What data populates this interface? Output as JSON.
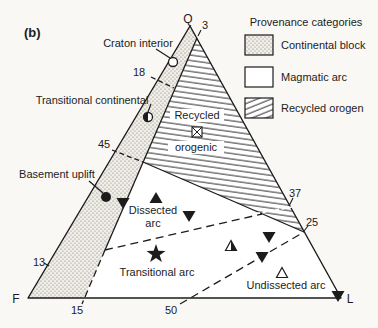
{
  "figure": {
    "panel_label": "(b)",
    "corners": {
      "top": "Q",
      "bottom_left": "F",
      "bottom_right": "L"
    },
    "ticks": {
      "t3": "3",
      "t18": "18",
      "t45": "45",
      "t13": "13",
      "t15": "15",
      "t50": "50",
      "t37": "37",
      "t25": "25"
    },
    "fields": {
      "craton_interior": "Craton interior",
      "transitional_continental": "Transitional continental",
      "basement_uplift": "Basement uplift",
      "recycled_line1": "Recycled",
      "recycled_line2": "orogenic",
      "dissected_line1": "Dissected",
      "dissected_line2": "arc",
      "transitional_arc": "Transitional arc",
      "undissected_arc": "Undissected arc"
    },
    "legend": {
      "title": "Provenance categories",
      "items": [
        {
          "label": "Continental block",
          "pattern": "stipple"
        },
        {
          "label": "Magmatic arc",
          "pattern": "none"
        },
        {
          "label": "Recycled orogen",
          "pattern": "hatch"
        }
      ]
    },
    "colors": {
      "ink": "#1c1c1c",
      "background": "#f9f8f5",
      "paper": "#ffffff"
    },
    "markers": [
      {
        "symbol": "circle-open",
        "x": 173,
        "y": 62,
        "field": "Craton interior"
      },
      {
        "symbol": "circle-half",
        "x": 148,
        "y": 117,
        "field": "Transitional continental"
      },
      {
        "symbol": "circle-filled",
        "x": 106,
        "y": 197,
        "field": "Basement uplift"
      },
      {
        "symbol": "square-x",
        "x": 197,
        "y": 132,
        "field": "Recycled orogenic"
      },
      {
        "symbol": "triangle-down-filled",
        "x": 123,
        "y": 203,
        "field": ""
      },
      {
        "symbol": "triangle-up-filled",
        "x": 156,
        "y": 198,
        "field": "Dissected arc"
      },
      {
        "symbol": "triangle-down-filled",
        "x": 189,
        "y": 216,
        "field": ""
      },
      {
        "symbol": "triangle-down-filled",
        "x": 269,
        "y": 237,
        "field": ""
      },
      {
        "symbol": "triangle-up-half",
        "x": 231,
        "y": 246,
        "field": ""
      },
      {
        "symbol": "triangle-down-filled",
        "x": 262,
        "y": 257,
        "field": ""
      },
      {
        "symbol": "star-filled",
        "x": 156,
        "y": 254,
        "field": "Transitional arc"
      },
      {
        "symbol": "triangle-up-open",
        "x": 282,
        "y": 273,
        "field": "Undissected arc"
      },
      {
        "symbol": "triangle-down-filled",
        "x": 338,
        "y": 296,
        "field": ""
      }
    ]
  }
}
